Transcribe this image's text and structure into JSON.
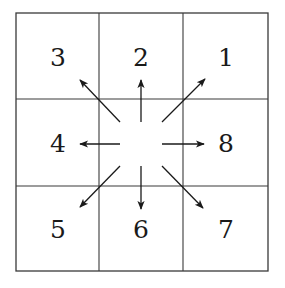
{
  "diagram": {
    "type": "direction-grid",
    "colors": {
      "line": "#3a3a3a",
      "arrow": "#1a1a1a",
      "text": "#1a1a1a",
      "background": "#ffffff"
    },
    "cells": [
      {
        "row": 0,
        "col": 0,
        "label": "3"
      },
      {
        "row": 0,
        "col": 1,
        "label": "2"
      },
      {
        "row": 0,
        "col": 2,
        "label": "1"
      },
      {
        "row": 1,
        "col": 0,
        "label": "4"
      },
      {
        "row": 1,
        "col": 1,
        "label": ""
      },
      {
        "row": 1,
        "col": 2,
        "label": "8"
      },
      {
        "row": 2,
        "col": 0,
        "label": "5"
      },
      {
        "row": 2,
        "col": 1,
        "label": "6"
      },
      {
        "row": 2,
        "col": 2,
        "label": "7"
      }
    ],
    "arrows": [
      {
        "to": "1",
        "direction": "north-east"
      },
      {
        "to": "2",
        "direction": "north"
      },
      {
        "to": "3",
        "direction": "north-west"
      },
      {
        "to": "4",
        "direction": "west"
      },
      {
        "to": "5",
        "direction": "south-west"
      },
      {
        "to": "6",
        "direction": "south"
      },
      {
        "to": "7",
        "direction": "south-east"
      },
      {
        "to": "8",
        "direction": "east"
      }
    ]
  }
}
